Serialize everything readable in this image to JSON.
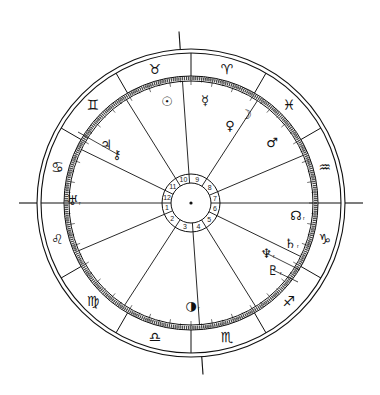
{
  "chart_title": "Natal chart wheel",
  "geometry": {
    "cx": 191,
    "cy": 203,
    "r_outer": 154,
    "r_outer2": 150,
    "r_sign_inner": 127,
    "r_degree_inner": 122,
    "r_hub_outer": 29,
    "r_hub_inner": 20
  },
  "asc_longitude": 120,
  "signs": [
    {
      "name": "Aries",
      "glyph": "♈",
      "start": 0
    },
    {
      "name": "Taurus",
      "glyph": "♉",
      "start": 30
    },
    {
      "name": "Gemini",
      "glyph": "♊",
      "start": 60
    },
    {
      "name": "Cancer",
      "glyph": "♋",
      "start": 90
    },
    {
      "name": "Leo",
      "glyph": "♌",
      "start": 120
    },
    {
      "name": "Virgo",
      "glyph": "♍",
      "start": 150
    },
    {
      "name": "Libra",
      "glyph": "♎",
      "start": 180
    },
    {
      "name": "Scorpio",
      "glyph": "♏",
      "start": 210
    },
    {
      "name": "Sagittarius",
      "glyph": "♐",
      "start": 240
    },
    {
      "name": "Capricorn",
      "glyph": "♑",
      "start": 270
    },
    {
      "name": "Aquarius",
      "glyph": "♒",
      "start": 300
    },
    {
      "name": "Pisces",
      "glyph": "♓",
      "start": 330
    }
  ],
  "houses": [
    {
      "number": "1",
      "cusp_angle": 180
    },
    {
      "number": "2",
      "cusp_angle": 203
    },
    {
      "number": "3",
      "cusp_angle": 237
    },
    {
      "number": "4",
      "cusp_angle": 274
    },
    {
      "number": "5",
      "cusp_angle": 302
    },
    {
      "number": "6",
      "cusp_angle": 334
    },
    {
      "number": "7",
      "cusp_angle": 0
    },
    {
      "number": "8",
      "cusp_angle": 23
    },
    {
      "number": "9",
      "cusp_angle": 57
    },
    {
      "number": "10",
      "cusp_angle": 94
    },
    {
      "number": "11",
      "cusp_angle": 122
    },
    {
      "number": "12",
      "cusp_angle": 154
    }
  ],
  "planets": [
    {
      "name": "Sun",
      "glyph": "☉",
      "x": 167,
      "y": 101,
      "retro": ""
    },
    {
      "name": "Mercury",
      "glyph": "☿",
      "x": 205,
      "y": 100,
      "retro": ""
    },
    {
      "name": "Moon",
      "glyph": "☽",
      "x": 246,
      "y": 114,
      "retro": ""
    },
    {
      "name": "Venus",
      "glyph": "♀",
      "x": 230,
      "y": 125,
      "retro": ""
    },
    {
      "name": "Mars",
      "glyph": "♂",
      "x": 272,
      "y": 142,
      "retro": ""
    },
    {
      "name": "Jupiter",
      "glyph": "♃",
      "x": 106,
      "y": 144,
      "retro": ""
    },
    {
      "name": "Chiron",
      "glyph": "⚷",
      "x": 117,
      "y": 154,
      "retro": ""
    },
    {
      "name": "Uranus",
      "glyph": "♅",
      "x": 72,
      "y": 200,
      "retro": "r"
    },
    {
      "name": "North Node",
      "glyph": "☊",
      "x": 296,
      "y": 215,
      "retro": "r"
    },
    {
      "name": "Saturn",
      "glyph": "♄",
      "x": 290,
      "y": 243,
      "retro": "r"
    },
    {
      "name": "Neptune",
      "glyph": "♆",
      "x": 266,
      "y": 253,
      "retro": "r"
    },
    {
      "name": "Pluto",
      "glyph": "♇",
      "x": 273,
      "y": 270,
      "retro": "r"
    },
    {
      "name": "Lilith / Moon-phase",
      "glyph": "◑",
      "x": 191,
      "y": 305,
      "retro": "r"
    }
  ],
  "colors": {
    "line": "#111111",
    "background": "#ffffff"
  }
}
